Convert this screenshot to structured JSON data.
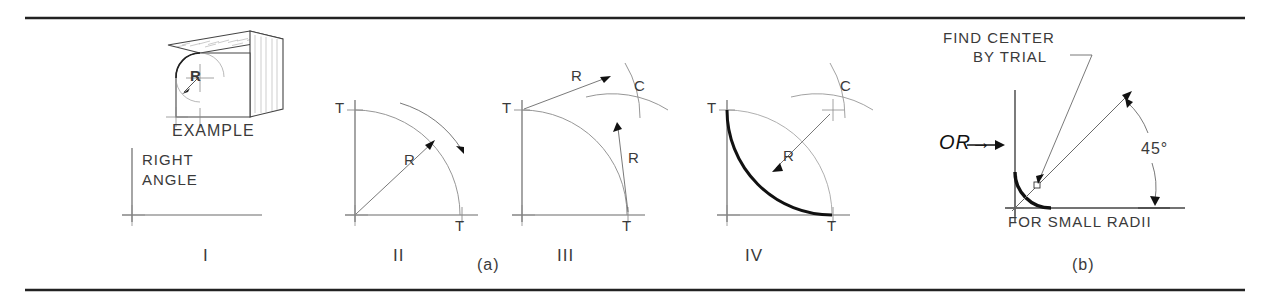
{
  "figure": {
    "border_color": "#222222",
    "line_color": "#5a5a5a",
    "heavy_line_color": "#111111",
    "text_color": "#3a3a3a"
  },
  "part_a": {
    "caption": "(a)",
    "example": {
      "label": "EXAMPLE",
      "radius_label": "R"
    },
    "steps": [
      {
        "numeral": "I",
        "labels": [
          "RIGHT",
          "ANGLE"
        ],
        "description": "Given right angle"
      },
      {
        "numeral": "II",
        "tangent_labels": [
          "T",
          "T"
        ],
        "radius_label": "R",
        "description": "Lay off radius R from corner to locate tangent points"
      },
      {
        "numeral": "III",
        "tangent_labels": [
          "T",
          "T"
        ],
        "radius_labels": [
          "R",
          "R"
        ],
        "center_label": "C",
        "description": "Swing arcs of radius R from tangent points to locate center C"
      },
      {
        "numeral": "IV",
        "tangent_labels": [
          "T",
          "T"
        ],
        "radius_label": "R",
        "center_label": "C",
        "description": "Draw required arc of radius R from T to T"
      }
    ]
  },
  "part_b": {
    "caption": "(b)",
    "or_label": "OR→",
    "note_lines": [
      "FIND CENTER",
      "BY TRIAL"
    ],
    "angle_label": "45°",
    "footnote": "FOR SMALL RADII"
  }
}
